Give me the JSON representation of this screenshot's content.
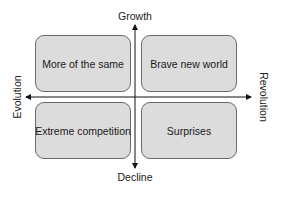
{
  "diagram": {
    "type": "2x2 matrix",
    "axes": {
      "top": "Growth",
      "bottom": "Decline",
      "left": "Evolution",
      "right": "Revolution"
    },
    "quadrants": {
      "top_left": "More of the same",
      "top_right": "Brave new world",
      "bottom_left": "Extreme competition",
      "bottom_right": "Surprises"
    },
    "colors": {
      "box_fill": "#dcdcdc",
      "box_border": "#6a6a6a",
      "axis": "#111111"
    }
  }
}
